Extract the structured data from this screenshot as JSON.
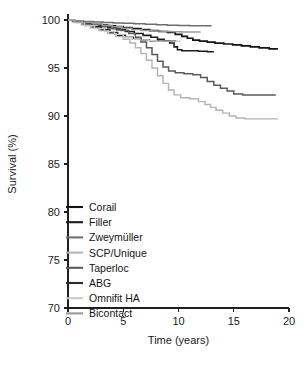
{
  "chart_data": {
    "type": "line",
    "title": "",
    "subtitle": "",
    "xlabel": "Time (years)",
    "ylabel": "Survival (%)",
    "xlim": [
      0,
      20
    ],
    "ylim": [
      70,
      100
    ],
    "xticks": [
      0,
      5,
      10,
      15,
      20
    ],
    "xtick_labels": [
      "0",
      "5",
      "10",
      "15",
      "20"
    ],
    "yticks": [
      70,
      75,
      80,
      85,
      90,
      95,
      100
    ],
    "ytick_labels": [
      "70",
      "75",
      "80",
      "85",
      "90",
      "95",
      "100"
    ],
    "grid": false,
    "legend_position": "lower-left-inside",
    "series": [
      {
        "name": "Corail",
        "color": "#141414",
        "width": 1.7,
        "points": [
          [
            0,
            100
          ],
          [
            0.4,
            99.9
          ],
          [
            1.0,
            99.8
          ],
          [
            1.6,
            99.7
          ],
          [
            2.2,
            99.6
          ],
          [
            2.9,
            99.5
          ],
          [
            3.6,
            99.4
          ],
          [
            4.3,
            99.3
          ],
          [
            5.0,
            99.2
          ],
          [
            5.8,
            99.1
          ],
          [
            6.6,
            99.0
          ],
          [
            7.4,
            98.9
          ],
          [
            8.2,
            98.8
          ],
          [
            9.0,
            98.7
          ],
          [
            9.7,
            98.5
          ],
          [
            10.3,
            98.3
          ],
          [
            10.8,
            98.1
          ],
          [
            11.3,
            97.9
          ],
          [
            11.9,
            97.8
          ],
          [
            12.6,
            97.7
          ],
          [
            13.3,
            97.6
          ],
          [
            14.1,
            97.5
          ],
          [
            14.9,
            97.4
          ],
          [
            15.7,
            97.3
          ],
          [
            16.5,
            97.2
          ],
          [
            17.3,
            97.1
          ],
          [
            18.2,
            97.0
          ],
          [
            19.0,
            97.0
          ]
        ]
      },
      {
        "name": "Filler",
        "color": "#1c1c1c",
        "width": 1.55,
        "points": [
          [
            0,
            100
          ],
          [
            0.5,
            99.9
          ],
          [
            1.2,
            99.8
          ],
          [
            2.0,
            99.6
          ],
          [
            2.8,
            99.4
          ],
          [
            3.6,
            99.2
          ],
          [
            4.4,
            99.0
          ],
          [
            5.2,
            98.8
          ],
          [
            6.0,
            98.6
          ],
          [
            6.8,
            98.4
          ],
          [
            7.5,
            98.2
          ],
          [
            8.1,
            98.0
          ],
          [
            8.7,
            97.8
          ],
          [
            9.2,
            97.6
          ],
          [
            9.6,
            97.2
          ],
          [
            9.9,
            96.9
          ],
          [
            10.3,
            96.8
          ],
          [
            11.0,
            96.8
          ],
          [
            11.8,
            96.75
          ],
          [
            12.6,
            96.7
          ],
          [
            13.2,
            96.7
          ]
        ]
      },
      {
        "name": "Zweymüller",
        "color": "#6e6e6e",
        "width": 1.5,
        "points": [
          [
            0,
            100
          ],
          [
            0.6,
            99.9
          ],
          [
            1.4,
            99.85
          ],
          [
            2.3,
            99.8
          ],
          [
            3.2,
            99.75
          ],
          [
            4.1,
            99.7
          ],
          [
            5.0,
            99.65
          ],
          [
            6.0,
            99.6
          ],
          [
            7.0,
            99.55
          ],
          [
            8.0,
            99.5
          ],
          [
            9.0,
            99.45
          ],
          [
            10.0,
            99.42
          ],
          [
            11.0,
            99.4
          ],
          [
            12.0,
            99.4
          ],
          [
            13.0,
            99.4
          ]
        ]
      },
      {
        "name": "SCP/Unique",
        "color": "#b4b4b4",
        "width": 1.45,
        "points": [
          [
            0,
            100
          ],
          [
            0.5,
            99.8
          ],
          [
            1.2,
            99.5
          ],
          [
            2.0,
            99.2
          ],
          [
            2.8,
            98.9
          ],
          [
            3.6,
            98.6
          ],
          [
            4.3,
            98.3
          ],
          [
            5.0,
            98.0
          ],
          [
            5.6,
            97.6
          ],
          [
            6.1,
            97.1
          ],
          [
            6.6,
            96.5
          ],
          [
            7.1,
            95.8
          ],
          [
            7.6,
            95.0
          ],
          [
            8.1,
            94.2
          ],
          [
            8.6,
            93.4
          ],
          [
            9.1,
            92.7
          ],
          [
            9.6,
            92.2
          ],
          [
            10.2,
            91.9
          ],
          [
            11.0,
            91.8
          ],
          [
            11.8,
            91.5
          ],
          [
            12.4,
            91.2
          ],
          [
            12.9,
            90.9
          ],
          [
            13.4,
            90.6
          ],
          [
            14.0,
            90.3
          ],
          [
            14.6,
            90.0
          ],
          [
            15.2,
            89.8
          ],
          [
            16.0,
            89.7
          ],
          [
            17.0,
            89.7
          ],
          [
            18.0,
            89.7
          ],
          [
            19.0,
            89.7
          ]
        ]
      },
      {
        "name": "Taperloc",
        "color": "#5a5a5a",
        "width": 1.5,
        "points": [
          [
            0,
            100
          ],
          [
            0.5,
            99.85
          ],
          [
            1.3,
            99.7
          ],
          [
            2.2,
            99.5
          ],
          [
            3.1,
            99.3
          ],
          [
            4.0,
            99.1
          ],
          [
            4.8,
            98.9
          ],
          [
            5.5,
            98.6
          ],
          [
            6.1,
            98.2
          ],
          [
            6.6,
            97.7
          ],
          [
            7.1,
            97.1
          ],
          [
            7.6,
            96.4
          ],
          [
            8.1,
            95.7
          ],
          [
            8.6,
            95.1
          ],
          [
            9.1,
            94.7
          ],
          [
            9.7,
            94.5
          ],
          [
            10.5,
            94.4
          ],
          [
            11.3,
            94.3
          ],
          [
            12.0,
            94.0
          ],
          [
            12.6,
            93.6
          ],
          [
            13.2,
            93.2
          ],
          [
            13.8,
            92.9
          ],
          [
            14.4,
            92.6
          ],
          [
            15.0,
            92.3
          ],
          [
            15.8,
            92.2
          ],
          [
            16.8,
            92.2
          ],
          [
            17.8,
            92.2
          ],
          [
            18.8,
            92.2
          ]
        ]
      },
      {
        "name": "ABG",
        "color": "#2a2a2a",
        "width": 1.5,
        "points": [
          [
            0,
            100
          ],
          [
            0.6,
            99.8
          ],
          [
            1.4,
            99.6
          ],
          [
            2.2,
            99.3
          ],
          [
            3.0,
            99.0
          ],
          [
            3.8,
            98.7
          ],
          [
            4.5,
            98.4
          ],
          [
            5.2,
            98.2
          ],
          [
            5.9,
            98.0
          ],
          [
            6.6,
            97.9
          ],
          [
            7.4,
            97.85
          ],
          [
            8.2,
            97.8
          ],
          [
            9.0,
            97.8
          ],
          [
            9.8,
            97.8
          ]
        ]
      },
      {
        "name": "Omnifit HA",
        "color": "#c8c8c8",
        "width": 1.4,
        "points": [
          [
            0,
            100
          ],
          [
            0.6,
            99.7
          ],
          [
            1.5,
            99.4
          ],
          [
            2.4,
            99.1
          ],
          [
            3.3,
            98.8
          ],
          [
            4.2,
            98.5
          ],
          [
            5.0,
            98.2
          ],
          [
            5.8,
            98.0
          ],
          [
            6.5,
            97.9
          ],
          [
            7.2,
            97.85
          ],
          [
            8.0,
            97.8
          ],
          [
            8.8,
            97.8
          ],
          [
            9.5,
            97.8
          ],
          [
            10.2,
            97.8
          ]
        ]
      },
      {
        "name": "Bicontact",
        "color": "#9a9a9a",
        "width": 1.45,
        "points": [
          [
            0,
            100
          ],
          [
            0.5,
            99.9
          ],
          [
            1.3,
            99.75
          ],
          [
            2.2,
            99.6
          ],
          [
            3.1,
            99.45
          ],
          [
            4.0,
            99.3
          ],
          [
            4.9,
            99.15
          ],
          [
            5.8,
            99.0
          ],
          [
            6.7,
            98.9
          ],
          [
            7.6,
            98.85
          ],
          [
            8.5,
            98.8
          ],
          [
            9.4,
            98.78
          ],
          [
            10.3,
            98.75
          ],
          [
            11.2,
            98.75
          ],
          [
            12.0,
            98.75
          ]
        ]
      }
    ]
  },
  "legend": {
    "items": [
      {
        "label": "Corail",
        "color": "#141414"
      },
      {
        "label": "Filler",
        "color": "#1c1c1c"
      },
      {
        "label": "Zweymüller",
        "color": "#6e6e6e"
      },
      {
        "label": "SCP/Unique",
        "color": "#b4b4b4"
      },
      {
        "label": "Taperloc",
        "color": "#5a5a5a"
      },
      {
        "label": "ABG",
        "color": "#2a2a2a"
      },
      {
        "label": "Omnifit HA",
        "color": "#c8c8c8"
      },
      {
        "label": "Bicontact",
        "color": "#9a9a9a"
      }
    ]
  },
  "axes": {
    "x_title": "Time (years)",
    "y_title": "Survival (%)"
  }
}
